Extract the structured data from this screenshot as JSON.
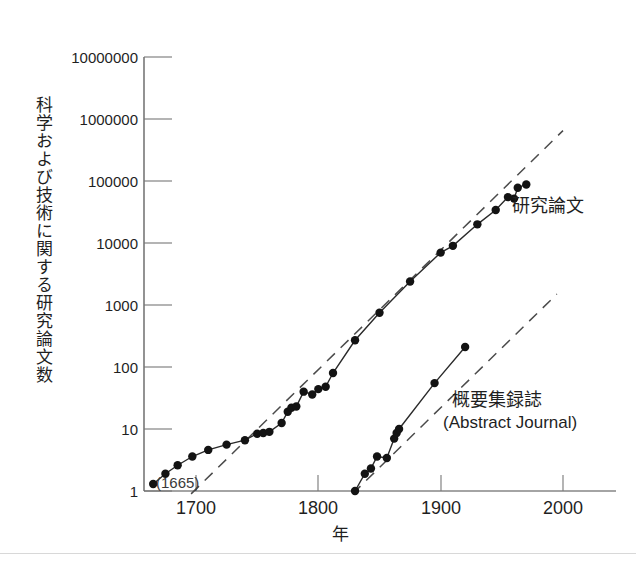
{
  "chart_data": {
    "type": "line",
    "title": "",
    "xlabel": "年",
    "ylabel": "科学および技術に関する研究論文数",
    "scale": {
      "x": "linear",
      "y": "log"
    },
    "xlim": [
      1650,
      2020
    ],
    "ylim": [
      1,
      10000000
    ],
    "grid": false,
    "legend_position": "inline-annotation",
    "x_ticks": [
      1700,
      1800,
      1900,
      2000
    ],
    "x_tick_labels": [
      "1700",
      "1800",
      "1900",
      "2000"
    ],
    "y_ticks": [
      1,
      10,
      100,
      1000,
      10000,
      100000,
      1000000,
      10000000
    ],
    "y_tick_labels": [
      "1",
      "10",
      "100",
      "1000",
      "10000",
      "100000",
      "1000000",
      "10000000"
    ],
    "annotations": [
      {
        "text": "(1665)",
        "x": 1665,
        "y": 1,
        "note": "origin year of first scientific journal"
      },
      {
        "text": "研究論文",
        "x": 1975,
        "y": 30000
      },
      {
        "text": "概要集録誌",
        "x": 1930,
        "y": 300
      },
      {
        "text": "(Abstract Journal)",
        "x": 1930,
        "y": 170
      }
    ],
    "series": [
      {
        "name": "研究論文",
        "label": "研究論文",
        "marker": "filled-circle",
        "line_style": "solid",
        "points": [
          {
            "x": 1665,
            "y": 1.3
          },
          {
            "x": 1675,
            "y": 1.9
          },
          {
            "x": 1685,
            "y": 2.6
          },
          {
            "x": 1697,
            "y": 3.6
          },
          {
            "x": 1710,
            "y": 4.6
          },
          {
            "x": 1725,
            "y": 5.6
          },
          {
            "x": 1740,
            "y": 6.6
          },
          {
            "x": 1750,
            "y": 8.4
          },
          {
            "x": 1755,
            "y": 8.6
          },
          {
            "x": 1760,
            "y": 9.0
          },
          {
            "x": 1770,
            "y": 12.5
          },
          {
            "x": 1775,
            "y": 19
          },
          {
            "x": 1778,
            "y": 22
          },
          {
            "x": 1782,
            "y": 23
          },
          {
            "x": 1788,
            "y": 40
          },
          {
            "x": 1795,
            "y": 36
          },
          {
            "x": 1800,
            "y": 44
          },
          {
            "x": 1806,
            "y": 48
          },
          {
            "x": 1812,
            "y": 80
          },
          {
            "x": 1830,
            "y": 270
          },
          {
            "x": 1850,
            "y": 750
          },
          {
            "x": 1875,
            "y": 2400
          },
          {
            "x": 1900,
            "y": 7000
          },
          {
            "x": 1910,
            "y": 9000
          },
          {
            "x": 1930,
            "y": 20000
          },
          {
            "x": 1945,
            "y": 34000
          },
          {
            "x": 1955,
            "y": 55000
          },
          {
            "x": 1960,
            "y": 52000
          },
          {
            "x": 1963,
            "y": 78000
          },
          {
            "x": 1970,
            "y": 88000
          }
        ]
      },
      {
        "name": "概要集録誌",
        "label": "概要集録誌 (Abstract Journal)",
        "marker": "filled-circle",
        "line_style": "solid",
        "points": [
          {
            "x": 1830,
            "y": 1.0
          },
          {
            "x": 1838,
            "y": 1.9
          },
          {
            "x": 1843,
            "y": 2.3
          },
          {
            "x": 1848,
            "y": 3.6
          },
          {
            "x": 1856,
            "y": 3.4
          },
          {
            "x": 1862,
            "y": 7.0
          },
          {
            "x": 1864,
            "y": 8.6
          },
          {
            "x": 1866,
            "y": 10
          },
          {
            "x": 1895,
            "y": 55
          },
          {
            "x": 1920,
            "y": 210
          }
        ]
      }
    ],
    "trend_lines": [
      {
        "name": "研究論文トレンド",
        "style": "dashed",
        "from": {
          "x": 1696,
          "y": 0.9
        },
        "to": {
          "x": 2000,
          "y": 650000
        },
        "doubling_note": "straight exponential reference line"
      },
      {
        "name": "概要集録誌トレンド",
        "style": "dashed",
        "from": {
          "x": 1828,
          "y": 0.9
        },
        "to": {
          "x": 1995,
          "y": 1500
        },
        "doubling_note": "straight exponential reference line"
      }
    ]
  },
  "axis": {
    "y_label": "科学および技術に関する研究論文数",
    "x_label": "年",
    "y_tick_labels": [
      "10000000",
      "1000000",
      "100000",
      "10000",
      "1000",
      "100",
      "10",
      "1"
    ],
    "x_tick_labels": [
      "1700",
      "1800",
      "1900",
      "2000"
    ]
  },
  "annotations": {
    "origin_year": "(1665)",
    "research_papers": "研究論文",
    "abstract_journal_jp": "概要集録誌",
    "abstract_journal_en": "(Abstract Journal)"
  },
  "colors": {
    "background": "#ffffff",
    "line": "#2a2a2a",
    "marker": "#131313",
    "trend": "#4b4b4b",
    "axis": "#4a4a4a",
    "text": "#1f1f1f"
  }
}
